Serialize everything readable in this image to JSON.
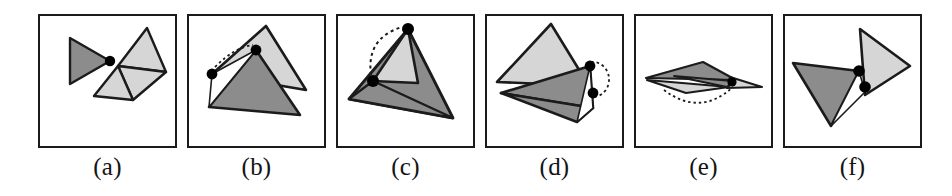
{
  "figure": {
    "type": "multi-panel-geometry-diagram",
    "background": "#ffffff",
    "width": 952,
    "height": 196,
    "panel_count": 6,
    "panel_box": {
      "width": 139,
      "height": 134,
      "top": 14,
      "border_color": "#1b1b1b",
      "border_width": 2
    },
    "style": {
      "dark_fill": "#8c8c8c",
      "light_fill": "#d6d6d6",
      "stroke": "#1b1b1b",
      "vertex_dot": "#000000",
      "arc_dash": "#1b1b1b"
    }
  },
  "panels": [
    {
      "id": "a",
      "caption": "(a)",
      "left": 38,
      "description": "One dark triangle touching a pivot dot on the left, and a light two-triangle strip on the right",
      "shapes": [
        {
          "name": "dark-triangle-left",
          "fill": "dark",
          "points": "32,24 32,70 72,47"
        },
        {
          "name": "light-triangle-upper-right",
          "fill": "light",
          "points": "109,14 128,58 80,52"
        },
        {
          "name": "light-triangle-lower-right",
          "fill": "light",
          "points": "80,52 128,58 95,86"
        },
        {
          "name": "light-triangle-lower-left",
          "fill": "light",
          "points": "56,82 80,52 95,86"
        }
      ],
      "dots": [
        {
          "name": "pivot-dot",
          "cx": 72,
          "cy": 47,
          "r": 5
        }
      ],
      "arcs": []
    },
    {
      "id": "b",
      "caption": "(b)",
      "left": 187,
      "description": "Light triangle and dark triangle sharing a hinge; a short dashed arc connects the two pivot dots",
      "shapes": [
        {
          "name": "light-triangle",
          "fill": "light",
          "points": "79,12 119,76 25,60"
        },
        {
          "name": "dark-triangle",
          "fill": "dark",
          "points": "69,36 113,101 22,93"
        },
        {
          "name": "hinge-wedge",
          "fill": "white",
          "points": "25,60 69,36 22,93"
        }
      ],
      "dots": [
        {
          "name": "pivot-dot-upper",
          "cx": 69,
          "cy": 36,
          "r": 5
        },
        {
          "name": "pivot-dot-lower",
          "cx": 25,
          "cy": 60,
          "r": 5
        }
      ],
      "arcs": [
        {
          "name": "rotation-arc",
          "path": "M 28,53 Q 48,33 66,31"
        }
      ]
    },
    {
      "id": "c",
      "caption": "(c)",
      "left": 336,
      "description": "Large dark triangle with a light triangular hole; dashed arc over the apex connects two pivot dots",
      "shapes": [
        {
          "name": "dark-triangle-outer",
          "fill": "dark",
          "points": "72,15 117,104 13,85"
        },
        {
          "name": "light-triangle-inner",
          "fill": "light",
          "points": "72,15 82,69 37,67"
        },
        {
          "name": "dark-triangle-lower",
          "fill": "dark",
          "points": "37,67 117,104 13,85"
        }
      ],
      "dots": [
        {
          "name": "pivot-dot-apex",
          "cx": 72,
          "cy": 15,
          "r": 6
        },
        {
          "name": "pivot-dot-center",
          "cx": 37,
          "cy": 67,
          "r": 6
        }
      ],
      "arcs": [
        {
          "name": "rotation-arc",
          "path": "M 35,61 Q 30,24 66,13"
        }
      ]
    },
    {
      "id": "d",
      "caption": "(d)",
      "left": 485,
      "description": "Light triangle above and dark triangle below joined at a hinge on the right; dashed arc loops around the two dots",
      "shapes": [
        {
          "name": "light-triangle",
          "fill": "light",
          "points": "66,10 104,72 12,68"
        },
        {
          "name": "dark-triangle-upper",
          "fill": "dark",
          "points": "105,52 108,94 16,79"
        },
        {
          "name": "dark-triangle-lower",
          "fill": "dark",
          "points": "16,79 108,94 92,108"
        },
        {
          "name": "hinge-wedge",
          "fill": "white",
          "points": "105,52 108,94 92,108"
        }
      ],
      "dots": [
        {
          "name": "pivot-dot-upper",
          "cx": 105,
          "cy": 52,
          "r": 5
        },
        {
          "name": "pivot-dot-lower",
          "cx": 108,
          "cy": 79,
          "r": 5
        }
      ],
      "arcs": [
        {
          "name": "rotation-arc",
          "path": "M 107,49 A 15,16 0 1 1 108,82"
        }
      ]
    },
    {
      "id": "e",
      "caption": "(e)",
      "left": 634,
      "description": "Flattened nearly-degenerate pair of triangles seen edge-on, with a dashed arc below the hinge",
      "shapes": [
        {
          "name": "dark-triangle",
          "fill": "dark",
          "points": "12,64 69,48 102,66"
        },
        {
          "name": "light-triangle-right",
          "fill": "light",
          "points": "102,66 128,73 95,73"
        },
        {
          "name": "light-triangle-lower",
          "fill": "light",
          "points": "12,64 95,73 52,79"
        },
        {
          "name": "dark-sliver",
          "fill": "dark",
          "points": "69,48 102,66 95,73"
        }
      ],
      "dots": [
        {
          "name": "pivot-dot",
          "cx": 98,
          "cy": 68,
          "r": 5
        }
      ],
      "arcs": [
        {
          "name": "rotation-arc",
          "path": "M 30,76 Q 66,104 100,74"
        }
      ]
    },
    {
      "id": "f",
      "caption": "(f)",
      "left": 783,
      "description": "Dark triangle on the left and light triangle on the right joined by two pivot dots at the center",
      "shapes": [
        {
          "name": "light-triangle-right",
          "fill": "light",
          "points": "77,15 127,52 82,81"
        },
        {
          "name": "dark-triangle-left",
          "fill": "dark",
          "points": "10,49 76,57 48,112"
        },
        {
          "name": "hinge-wedge",
          "fill": "white",
          "points": "76,57 82,81 48,112"
        }
      ],
      "dots": [
        {
          "name": "pivot-dot-upper",
          "cx": 76,
          "cy": 57,
          "r": 6
        },
        {
          "name": "pivot-dot-lower",
          "cx": 82,
          "cy": 73,
          "r": 6
        }
      ],
      "arcs": []
    }
  ]
}
